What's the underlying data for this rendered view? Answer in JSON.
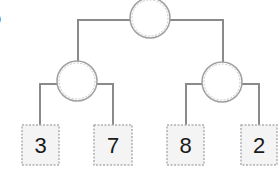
{
  "diagram": {
    "type": "binary-tree",
    "partial_label": "6",
    "colors": {
      "line": "#888888",
      "node_border": "#a8a8a8",
      "leaf_fill": "#f4f4f4",
      "text": "#1a1a1a"
    },
    "nodes": {
      "root": {
        "label": ""
      },
      "left": {
        "label": ""
      },
      "right": {
        "label": ""
      }
    },
    "leaves": [
      {
        "value": "3"
      },
      {
        "value": "7"
      },
      {
        "value": "8"
      },
      {
        "value": "2"
      }
    ]
  }
}
